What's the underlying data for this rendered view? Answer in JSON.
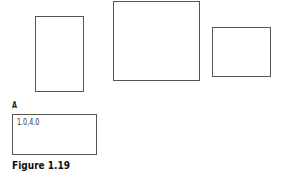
{
  "figure": {
    "caption": "Figure 1.19",
    "rectangles": [
      {
        "id": "rect-1",
        "label": ""
      },
      {
        "id": "rect-2",
        "label": ""
      },
      {
        "id": "rect-3",
        "label": ""
      }
    ],
    "labeled_rect": {
      "label": "A",
      "coordinates": "1.0,4.0"
    }
  }
}
